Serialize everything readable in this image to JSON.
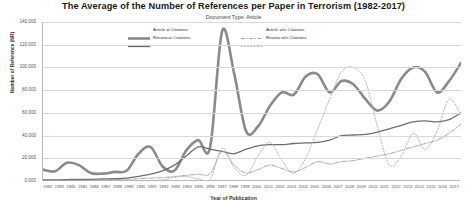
{
  "chart_data": {
    "type": "line",
    "title": "The Average of the Number of References per Paper in Terrorism (1982-2017)",
    "subtitle": "Document Type: Article",
    "xlabel": "Year of Publication",
    "ylabel": "Number of Reference (NR)",
    "ylim": [
      0,
      140
    ],
    "yticks": [
      "0.000",
      "20.000",
      "40.000",
      "60.000",
      "80.000",
      "100.000",
      "120.000",
      "140.000"
    ],
    "grid": true,
    "legend_position": "top-center",
    "categories": [
      "1982",
      "1983",
      "1984",
      "1985",
      "1986",
      "1987",
      "1988",
      "1989",
      "1990",
      "1991",
      "1992",
      "1993",
      "1994",
      "1995",
      "1996",
      "1997",
      "1998",
      "1999",
      "2000",
      "2001",
      "2002",
      "2003",
      "2004",
      "2005",
      "2006",
      "2007",
      "2008",
      "2009",
      "2010",
      "2011",
      "2012",
      "2013",
      "2014",
      "2015",
      "2016",
      "2017"
    ],
    "series": [
      {
        "name": "Article w Citations",
        "style": "solid-thick",
        "color": "#8a8a8a",
        "values": [
          10.0,
          8.5,
          16.0,
          14.0,
          7.0,
          6.5,
          8.0,
          9.0,
          24.0,
          30.0,
          13.0,
          9.0,
          27.0,
          36.0,
          30.0,
          132.0,
          95.0,
          44.0,
          48.0,
          66.0,
          78.0,
          76.0,
          92.0,
          94.0,
          78.0,
          88.0,
          85.0,
          72.0,
          62.0,
          70.0,
          90.0,
          100.0,
          96.0,
          78.0,
          88.0,
          104.0
        ]
      },
      {
        "name": "Review w Citations",
        "style": "solid-thin",
        "color": "#6e6e6e",
        "values": [
          1.0,
          1.0,
          1.2,
          1.5,
          1.5,
          1.8,
          2.0,
          2.5,
          4.0,
          6.0,
          9.0,
          14.0,
          22.0,
          30.0,
          28.0,
          26.0,
          24.0,
          28.0,
          31.0,
          32.0,
          32.0,
          33.0,
          33.5,
          34.0,
          36.0,
          40.0,
          40.5,
          41.0,
          43.0,
          46.0,
          49.0,
          52.0,
          53.0,
          52.0,
          54.0,
          60.0
        ]
      },
      {
        "name": "Article w/o Citations",
        "style": "dash-dot",
        "color": "#9a9a9a",
        "values": [
          0.5,
          0.5,
          0.6,
          0.7,
          0.8,
          1.0,
          1.2,
          1.5,
          2.0,
          2.5,
          3.0,
          4.0,
          5.0,
          6.0,
          6.5,
          26.0,
          14.0,
          7.0,
          10.0,
          14.0,
          11.0,
          8.0,
          12.0,
          17.0,
          15.0,
          17.0,
          18.0,
          20.0,
          22.0,
          24.0,
          27.0,
          30.0,
          33.0,
          36.0,
          42.0,
          50.0
        ]
      },
      {
        "name": "Review w/o Citations",
        "style": "dotted",
        "color": "#b0b0b0",
        "values": [
          0.0,
          0.0,
          0.0,
          0.0,
          0.0,
          0.0,
          0.0,
          0.0,
          0.0,
          0.0,
          1.0,
          3.0,
          4.0,
          2.0,
          1.5,
          29.0,
          12.0,
          5.0,
          22.0,
          34.0,
          18.0,
          7.0,
          20.0,
          46.0,
          72.0,
          96.0,
          100.0,
          88.0,
          48.0,
          14.0,
          22.0,
          42.0,
          28.0,
          44.0,
          72.0,
          58.0
        ]
      }
    ]
  }
}
